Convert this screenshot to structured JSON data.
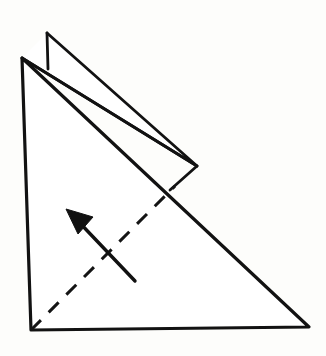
{
  "figure": {
    "title": "Origami fold step diagram",
    "background_color": "#fdfdfb",
    "paper_fill_color": "#ffffff",
    "ink_color": "#121212",
    "canvas": {
      "width": 326,
      "height": 356
    }
  },
  "shapes": {
    "main_triangle": {
      "name": "main-paper-triangle",
      "points": "22,58 309,327 31,330",
      "stroke_width": 3.2
    },
    "flap_outline": {
      "name": "folded-flap",
      "points": "47,33 197,166 22,58",
      "stroke_width": 2.8
    },
    "flap_notch": {
      "name": "flap-notch-edge",
      "points": "47,33 48,69",
      "stroke_width": 2.8
    },
    "flap_lower_edge": {
      "name": "flap-lower-edge",
      "points": "22,58 197,166",
      "stroke_width": 2.8
    },
    "flap_tail_edge": {
      "name": "flap-tail-edge",
      "points": "197,166 170,190",
      "stroke_width": 2.8
    }
  },
  "crease": {
    "name": "valley-fold-crease",
    "points": "31,330 175,186",
    "stroke_width": 3.0,
    "dash_pattern": "14 11",
    "label": "valley fold crease"
  },
  "arrow": {
    "name": "fold-direction-arrow",
    "shaft_points": "135,281 77,220",
    "stroke_width": 3.4,
    "head_points": "66,209 93,217 78,234",
    "direction": "up-left",
    "label": "fold direction"
  }
}
